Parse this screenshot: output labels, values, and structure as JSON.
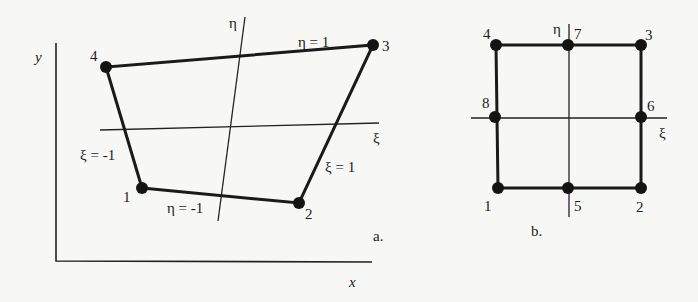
{
  "figure_a": {
    "caption": "a.",
    "axis_x_label": "x",
    "axis_y_label": "y",
    "xi_axis_label": "ξ",
    "eta_axis_label": "η",
    "edge_labels": {
      "top": "η = 1",
      "bottom": "η = -1",
      "left": "ξ = -1",
      "right": "ξ = 1"
    },
    "nodes": [
      {
        "id": "1",
        "x": 142,
        "y": 188
      },
      {
        "id": "2",
        "x": 299,
        "y": 203
      },
      {
        "id": "3",
        "x": 373,
        "y": 45
      },
      {
        "id": "4",
        "x": 106,
        "y": 67
      }
    ]
  },
  "figure_b": {
    "caption": "b.",
    "xi_axis_label": "ξ",
    "eta_axis_label": "η",
    "nodes": [
      {
        "id": "1",
        "x": 498,
        "y": 188
      },
      {
        "id": "2",
        "x": 641,
        "y": 188
      },
      {
        "id": "3",
        "x": 641,
        "y": 45
      },
      {
        "id": "4",
        "x": 496,
        "y": 45
      },
      {
        "id": "5",
        "x": 568,
        "y": 188
      },
      {
        "id": "6",
        "x": 641,
        "y": 117
      },
      {
        "id": "7",
        "x": 568,
        "y": 45
      },
      {
        "id": "8",
        "x": 495,
        "y": 117
      }
    ]
  },
  "colors": {
    "background": "#f7f7f5",
    "ink": "#1a1a1a"
  }
}
